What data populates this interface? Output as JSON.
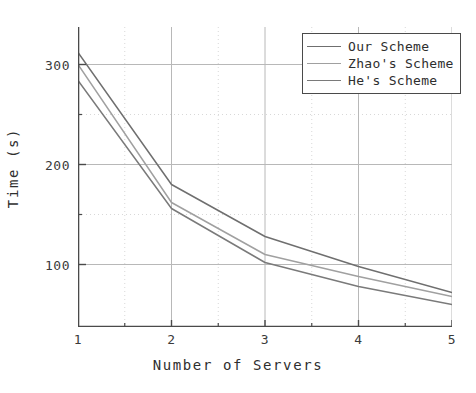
{
  "chart_data": {
    "type": "line",
    "title": "",
    "xlabel": "Number of Servers",
    "ylabel": "Time (s)",
    "x": [
      1,
      2,
      3,
      4,
      5
    ],
    "xlim": [
      1,
      5
    ],
    "ylim": [
      37.5,
      337.5
    ],
    "xticks": [
      "1",
      "2",
      "3",
      "4",
      "5"
    ],
    "yticks": [
      "100",
      "200",
      "300"
    ],
    "ytick_values": [
      100,
      200,
      300
    ],
    "yminor_values": [
      150,
      250
    ],
    "grid": true,
    "legend_position": "top-right",
    "series": [
      {
        "name": "Our Scheme",
        "values": [
          312,
          180,
          128,
          98,
          72
        ],
        "color": "#6f6f6f"
      },
      {
        "name": "Zhao's Scheme",
        "values": [
          300,
          162,
          110,
          88,
          68
        ],
        "color": "#a0a0a0"
      },
      {
        "name": "He's Scheme",
        "values": [
          284,
          156,
          102,
          78,
          60
        ],
        "color": "#7a7a7a"
      }
    ]
  },
  "legend": {
    "items": [
      {
        "label": "Our Scheme"
      },
      {
        "label": "Zhao's Scheme"
      },
      {
        "label": "He's Scheme"
      }
    ]
  },
  "axes": {
    "x_title": "Number of Servers",
    "y_title": "Time (s)"
  }
}
